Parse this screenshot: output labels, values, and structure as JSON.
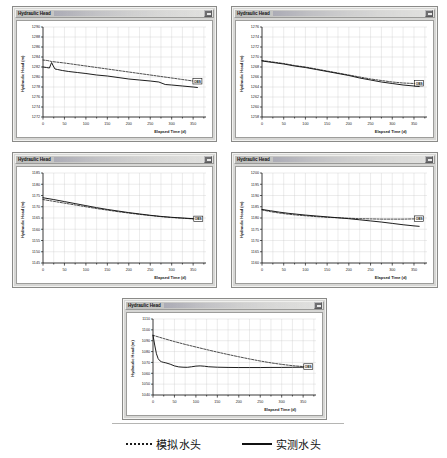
{
  "window": {
    "title": "Hydraulic Head",
    "close_button": "close-box",
    "redacted_title_suffix": ""
  },
  "legend": {
    "items": [
      {
        "style": "dotted",
        "label": "模拟水头"
      },
      {
        "style": "solid",
        "label": "实测水头"
      }
    ]
  },
  "axis": {
    "xlabel": "Elapsed Time (d)",
    "ylabel": "Hydraulic Head (m)",
    "xticks": [
      "0",
      "50",
      "100",
      "150",
      "200",
      "250",
      "300",
      "350"
    ]
  },
  "chart_data": [
    {
      "id": "chart-1",
      "type": "line",
      "title": "Hydraulic Head",
      "xlabel": "Elapsed Time (d)",
      "ylabel": "Hydraulic Head (m)",
      "xlim": [
        0,
        380
      ],
      "ylim": [
        1272,
        1290
      ],
      "xticks": [
        0,
        50,
        100,
        150,
        200,
        250,
        300,
        350
      ],
      "yticks": [
        1272,
        1274,
        1276,
        1278,
        1280,
        1282,
        1284,
        1286,
        1288,
        1290
      ],
      "ytick_labels": [
        "1272",
        "1274",
        "1276",
        "1278",
        "1280",
        "1282",
        "1284",
        "1286",
        "1288",
        "1290"
      ],
      "grid": true,
      "end_label": "OBS",
      "series": [
        {
          "name": "模拟水头",
          "style": "dotted",
          "x": [
            0,
            10,
            20,
            30,
            50,
            75,
            100,
            125,
            150,
            175,
            200,
            225,
            250,
            275,
            300,
            325,
            350,
            360
          ],
          "y": [
            1283.4,
            1283.3,
            1283.1,
            1283.0,
            1282.8,
            1282.5,
            1282.2,
            1281.9,
            1281.6,
            1281.3,
            1281.0,
            1280.7,
            1280.4,
            1280.1,
            1279.8,
            1279.5,
            1279.2,
            1279.1
          ]
        },
        {
          "name": "实测水头",
          "style": "solid",
          "x": [
            0,
            8,
            15,
            20,
            24,
            28,
            34,
            45,
            60,
            80,
            100,
            125,
            150,
            175,
            200,
            225,
            250,
            270,
            285,
            300,
            325,
            350,
            360
          ],
          "y": [
            1282.0,
            1281.9,
            1281.8,
            1282.9,
            1282.2,
            1281.6,
            1281.5,
            1281.3,
            1281.1,
            1280.9,
            1280.7,
            1280.4,
            1280.2,
            1279.9,
            1279.6,
            1279.4,
            1279.2,
            1279.0,
            1278.5,
            1278.4,
            1278.2,
            1278.0,
            1277.9
          ]
        }
      ]
    },
    {
      "id": "chart-2",
      "type": "line",
      "title": "Hydraulic Head",
      "xlabel": "Elapsed Time (d)",
      "ylabel": "Hydraulic Head (m)",
      "xlim": [
        0,
        380
      ],
      "ylim": [
        1258,
        1276
      ],
      "xticks": [
        0,
        50,
        100,
        150,
        200,
        250,
        300,
        350
      ],
      "yticks": [
        1258,
        1260,
        1262,
        1264,
        1266,
        1268,
        1270,
        1272,
        1274,
        1276
      ],
      "ytick_labels": [
        "1258",
        "1260",
        "1262",
        "1264",
        "1266",
        "1268",
        "1270",
        "1272",
        "1274",
        "1276"
      ],
      "grid": true,
      "end_label": "OBS",
      "series": [
        {
          "name": "模拟水头",
          "style": "dotted",
          "x": [
            0,
            25,
            50,
            75,
            100,
            125,
            150,
            175,
            200,
            225,
            250,
            275,
            300,
            325,
            350,
            362
          ],
          "y": [
            1269.3,
            1269.0,
            1268.7,
            1268.3,
            1268.0,
            1267.6,
            1267.2,
            1266.8,
            1266.4,
            1266.0,
            1265.6,
            1265.3,
            1265.0,
            1264.8,
            1264.7,
            1264.7
          ]
        },
        {
          "name": "实测水头",
          "style": "solid",
          "x": [
            0,
            25,
            50,
            75,
            100,
            125,
            150,
            175,
            200,
            225,
            250,
            275,
            300,
            325,
            350,
            362
          ],
          "y": [
            1269.2,
            1268.9,
            1268.6,
            1268.2,
            1267.9,
            1267.5,
            1267.1,
            1266.7,
            1266.3,
            1265.8,
            1265.4,
            1265.0,
            1264.7,
            1264.4,
            1264.2,
            1264.1
          ]
        }
      ]
    },
    {
      "id": "chart-3",
      "type": "line",
      "title": "Hydraulic Head",
      "xlabel": "Elapsed Time (d)",
      "ylabel": "Hydraulic Head (m)",
      "xlim": [
        0,
        380
      ],
      "ylim": [
        1145,
        1185
      ],
      "xticks": [
        0,
        50,
        100,
        150,
        200,
        250,
        300,
        350
      ],
      "yticks": [
        1145,
        1150,
        1155,
        1160,
        1165,
        1170,
        1175,
        1180,
        1185
      ],
      "ytick_labels": [
        "1145",
        "1150",
        "1155",
        "1160",
        "1165",
        "1170",
        "1175",
        "1180",
        "1185"
      ],
      "grid": true,
      "end_label": "OBS",
      "series": [
        {
          "name": "模拟水头",
          "style": "dotted",
          "x": [
            0,
            25,
            50,
            75,
            100,
            125,
            150,
            175,
            200,
            225,
            250,
            275,
            300,
            325,
            350,
            362
          ],
          "y": [
            1173.2,
            1172.4,
            1171.6,
            1170.8,
            1170.0,
            1169.2,
            1168.5,
            1167.8,
            1167.2,
            1166.6,
            1166.1,
            1165.6,
            1165.2,
            1164.9,
            1164.6,
            1164.5
          ]
        },
        {
          "name": "实测水头",
          "style": "solid",
          "x": [
            0,
            25,
            50,
            75,
            100,
            125,
            150,
            175,
            200,
            225,
            250,
            275,
            300,
            325,
            350,
            362
          ],
          "y": [
            1174.0,
            1173.2,
            1172.3,
            1171.4,
            1170.5,
            1169.6,
            1168.8,
            1168.1,
            1167.4,
            1166.8,
            1166.2,
            1165.7,
            1165.3,
            1165.0,
            1164.7,
            1164.6
          ]
        }
      ]
    },
    {
      "id": "chart-4",
      "type": "line",
      "title": "Hydraulic Head",
      "xlabel": "Elapsed Time (d)",
      "ylabel": "Hydraulic Head (m)",
      "xlim": [
        0,
        380
      ],
      "ylim": [
        1160,
        1200
      ],
      "xticks": [
        0,
        50,
        100,
        150,
        200,
        250,
        300,
        350
      ],
      "yticks": [
        1160,
        1165,
        1170,
        1175,
        1180,
        1185,
        1190,
        1195,
        1200
      ],
      "ytick_labels": [
        "1160",
        "1165",
        "1170",
        "1175",
        "1180",
        "1185",
        "1190",
        "1195",
        "1200"
      ],
      "grid": true,
      "end_label": "OBS",
      "series": [
        {
          "name": "模拟水头",
          "style": "dotted",
          "x": [
            0,
            20,
            40,
            60,
            80,
            100,
            125,
            150,
            175,
            200,
            225,
            250,
            275,
            300,
            325,
            350,
            362
          ],
          "y": [
            1183.6,
            1182.8,
            1182.2,
            1181.7,
            1181.3,
            1181.0,
            1180.6,
            1180.3,
            1180.1,
            1179.9,
            1179.7,
            1179.6,
            1179.5,
            1179.5,
            1179.5,
            1179.6,
            1179.6
          ]
        },
        {
          "name": "实测水头",
          "style": "solid",
          "x": [
            0,
            20,
            40,
            60,
            80,
            100,
            125,
            150,
            175,
            200,
            225,
            250,
            275,
            300,
            325,
            350,
            362
          ],
          "y": [
            1183.8,
            1183.2,
            1182.6,
            1182.1,
            1181.7,
            1181.3,
            1180.9,
            1180.5,
            1180.1,
            1179.7,
            1179.2,
            1178.7,
            1178.2,
            1177.6,
            1177.0,
            1176.5,
            1176.3
          ]
        }
      ]
    },
    {
      "id": "chart-5",
      "type": "line",
      "title": "Hydraulic Head",
      "xlabel": "Elapsed Time (d)",
      "ylabel": "Hydraulic Head (m)",
      "xlim": [
        0,
        380
      ],
      "ylim": [
        1040,
        1110
      ],
      "xticks": [
        0,
        50,
        100,
        150,
        200,
        250,
        300,
        350
      ],
      "yticks": [
        1040,
        1050,
        1060,
        1070,
        1080,
        1090,
        1100,
        1110
      ],
      "ytick_labels": [
        "1040",
        "1050",
        "1060",
        "1070",
        "1080",
        "1090",
        "1100",
        "1110"
      ],
      "grid": true,
      "end_label": "OBS",
      "series": [
        {
          "name": "模拟水头",
          "style": "dotted",
          "x": [
            0,
            25,
            50,
            75,
            100,
            125,
            150,
            175,
            200,
            225,
            250,
            275,
            300,
            325,
            350,
            362
          ],
          "y": [
            1095.0,
            1092.0,
            1089.2,
            1086.6,
            1084.2,
            1081.8,
            1079.5,
            1077.3,
            1075.2,
            1073.2,
            1071.3,
            1069.6,
            1068.2,
            1067.0,
            1066.2,
            1066.0
          ]
        },
        {
          "name": "实测水头",
          "style": "solid",
          "x": [
            0,
            4,
            8,
            12,
            16,
            20,
            25,
            30,
            40,
            50,
            60,
            70,
            80,
            90,
            100,
            110,
            120,
            130,
            150,
            175,
            200,
            225,
            250,
            275,
            300,
            325,
            350,
            362
          ],
          "y": [
            1095.0,
            1086.0,
            1078.0,
            1073.5,
            1071.5,
            1070.6,
            1070.0,
            1069.6,
            1068.4,
            1066.8,
            1065.9,
            1065.6,
            1065.5,
            1066.0,
            1066.6,
            1066.8,
            1066.5,
            1066.0,
            1065.6,
            1065.4,
            1065.3,
            1065.3,
            1065.3,
            1065.4,
            1065.4,
            1065.5,
            1065.6,
            1065.6
          ]
        }
      ]
    }
  ]
}
